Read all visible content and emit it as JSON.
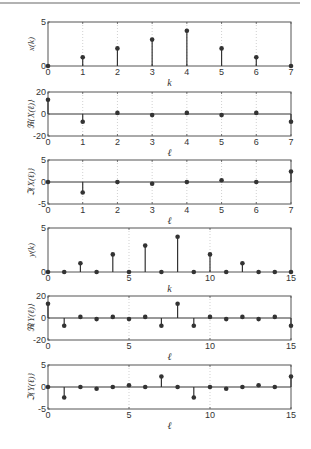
{
  "page": {
    "rule_color": "#999999",
    "axes_color": "#555555",
    "grid_color": "#bbbbbb",
    "stem_color": "#333333"
  },
  "chart_data": [
    {
      "type": "stem",
      "name": "x-k",
      "xlabel": "k",
      "ylabel": "x(k)",
      "x": [
        0,
        1,
        2,
        3,
        4,
        5,
        6,
        7
      ],
      "values": [
        0,
        1,
        2,
        3,
        4,
        2,
        1,
        0
      ],
      "xlim": [
        0,
        7
      ],
      "ylim": [
        0,
        5
      ],
      "xticks": [
        0,
        1,
        2,
        3,
        4,
        5,
        6,
        7
      ],
      "yticks": [
        0,
        5
      ],
      "grid": "vertical-dotted"
    },
    {
      "type": "stem",
      "name": "re-X",
      "xlabel": "ℓ",
      "ylabel": "ℜ{X(ℓ)}",
      "x": [
        0,
        1,
        2,
        3,
        4,
        5,
        6,
        7
      ],
      "values": [
        13,
        -7,
        1,
        -1,
        1,
        -1,
        1,
        -7
      ],
      "xlim": [
        0,
        7
      ],
      "ylim": [
        -20,
        20
      ],
      "xticks": [
        0,
        1,
        2,
        3,
        4,
        5,
        6,
        7
      ],
      "yticks": [
        -20,
        0,
        20
      ],
      "grid": "vertical-dotted"
    },
    {
      "type": "stem",
      "name": "im-X",
      "xlabel": "ℓ",
      "ylabel": "ℑ{X(ℓ)}",
      "x": [
        0,
        1,
        2,
        3,
        4,
        5,
        6,
        7
      ],
      "values": [
        0,
        -2.4,
        0,
        -0.4,
        0,
        0.4,
        0,
        2.4
      ],
      "xlim": [
        0,
        7
      ],
      "ylim": [
        -5,
        5
      ],
      "xticks": [
        0,
        1,
        2,
        3,
        4,
        5,
        6,
        7
      ],
      "yticks": [
        -5,
        0,
        5
      ],
      "grid": "vertical-dotted"
    },
    {
      "type": "stem",
      "name": "y-k",
      "xlabel": "k",
      "ylabel": "y(k)",
      "x": [
        0,
        1,
        2,
        3,
        4,
        5,
        6,
        7,
        8,
        9,
        10,
        11,
        12,
        13,
        14,
        15
      ],
      "values": [
        0,
        0,
        1,
        0,
        2,
        0,
        3,
        0,
        4,
        0,
        2,
        0,
        1,
        0,
        0,
        0
      ],
      "xlim": [
        0,
        15
      ],
      "ylim": [
        0,
        5
      ],
      "xticks": [
        0,
        5,
        10,
        15
      ],
      "yticks": [
        0,
        5
      ],
      "grid": "vertical-dotted"
    },
    {
      "type": "stem",
      "name": "re-Y",
      "xlabel": "ℓ",
      "ylabel": "ℜ{Y(ℓ)}",
      "x": [
        0,
        1,
        2,
        3,
        4,
        5,
        6,
        7,
        8,
        9,
        10,
        11,
        12,
        13,
        14,
        15
      ],
      "values": [
        13,
        -7,
        1,
        -1,
        1,
        -1,
        1,
        -7,
        13,
        -7,
        1,
        -1,
        1,
        -1,
        1,
        -7
      ],
      "xlim": [
        0,
        15
      ],
      "ylim": [
        -20,
        20
      ],
      "xticks": [
        0,
        5,
        10,
        15
      ],
      "yticks": [
        -20,
        0,
        20
      ],
      "grid": "vertical-dotted"
    },
    {
      "type": "stem",
      "name": "im-Y",
      "xlabel": "ℓ",
      "ylabel": "ℑ{Y(ℓ)}",
      "x": [
        0,
        1,
        2,
        3,
        4,
        5,
        6,
        7,
        8,
        9,
        10,
        11,
        12,
        13,
        14,
        15
      ],
      "values": [
        0,
        -2.4,
        0,
        -0.4,
        0,
        0.4,
        0,
        2.4,
        0,
        -2.4,
        0,
        -0.4,
        0,
        0.4,
        0,
        2.4
      ],
      "xlim": [
        0,
        15
      ],
      "ylim": [
        -5,
        5
      ],
      "xticks": [
        0,
        5,
        10,
        15
      ],
      "yticks": [
        -5,
        0,
        5
      ],
      "grid": "vertical-dotted"
    }
  ]
}
